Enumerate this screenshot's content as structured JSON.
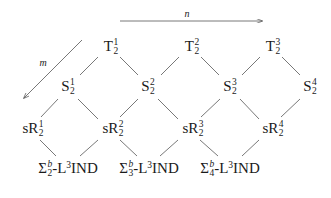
{
  "diagram": {
    "axes": {
      "n": {
        "label": "n",
        "direction": "right"
      },
      "m": {
        "label": "m",
        "direction": "down-left"
      }
    },
    "rows": {
      "T": [
        {
          "base": "T",
          "sup": "1",
          "sub": "2"
        },
        {
          "base": "T",
          "sup": "2",
          "sub": "2"
        },
        {
          "base": "T",
          "sup": "3",
          "sub": "2"
        }
      ],
      "S": [
        {
          "base": "S",
          "sup": "1",
          "sub": "2"
        },
        {
          "base": "S",
          "sup": "2",
          "sub": "2"
        },
        {
          "base": "S",
          "sup": "3",
          "sub": "2"
        },
        {
          "base": "S",
          "sup": "4",
          "sub": "2"
        }
      ],
      "sR": [
        {
          "base": "sR",
          "sup": "1",
          "sub": "2"
        },
        {
          "base": "sR",
          "sup": "2",
          "sub": "2"
        },
        {
          "base": "sR",
          "sup": "3",
          "sub": "2"
        },
        {
          "base": "sR",
          "sup": "4",
          "sub": "2"
        }
      ],
      "Sigma": [
        {
          "base": "Σ",
          "sup": "b",
          "sub": "2",
          "suffix_a": "-L",
          "suffix_sup": "3",
          "suffix_b": "IND"
        },
        {
          "base": "Σ",
          "sup": "b",
          "sub": "3",
          "suffix_a": "-L",
          "suffix_sup": "3",
          "suffix_b": "IND"
        },
        {
          "base": "Σ",
          "sup": "b",
          "sub": "4",
          "suffix_a": "-L",
          "suffix_sup": "3",
          "suffix_b": "IND"
        }
      ]
    },
    "colors": {
      "line": "#555555",
      "text": "#1a1a1a",
      "background": "#ffffff"
    }
  }
}
